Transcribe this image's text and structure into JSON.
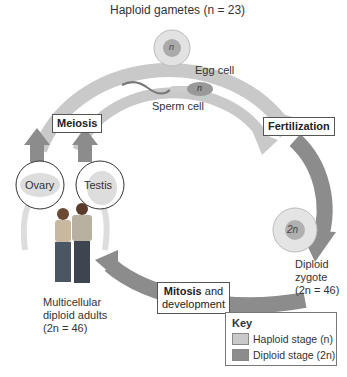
{
  "title": "Haploid gametes (n = 23)",
  "labels": {
    "egg_cell": "Egg cell",
    "sperm_cell": "Sperm cell",
    "egg_nucleus": "n",
    "sperm_nucleus": "n",
    "zygote_nucleus": "2n",
    "zygote": [
      "Diploid",
      "zygote",
      "(2n = 46)"
    ],
    "adults": [
      "Multicellular",
      "diploid adults",
      "(2n = 46)"
    ],
    "ovary": "Ovary",
    "testis": "Testis"
  },
  "stages": {
    "meiosis": "Meiosis",
    "fertilization": "Fertilization",
    "mitosis_bold": "Mitosis",
    "mitosis_rest": " and",
    "mitosis_line2": "development"
  },
  "key": {
    "title": "Key",
    "items": [
      {
        "label": "Haploid stage (n)",
        "color": "#c9c9c9"
      },
      {
        "label": "Diploid stage (2n)",
        "color": "#8c8c8c"
      }
    ]
  },
  "colors": {
    "haploid": "#c9c9c9",
    "diploid": "#8c8c8c"
  }
}
